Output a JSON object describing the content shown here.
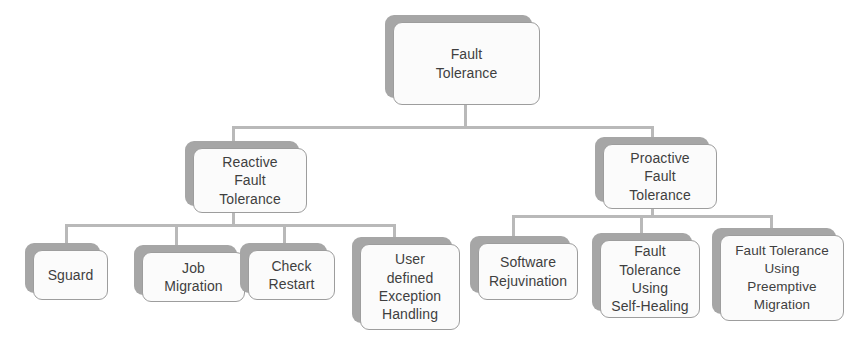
{
  "diagram": {
    "title": "Fault Tolerance",
    "type": "hierarchy-tree",
    "colors": {
      "background": "#ffffff",
      "box_fill": "#fbfbfb",
      "box_border": "#9d9d9d",
      "box_shadow_plate": "#a6a6a6",
      "connector": "#b9b9b9",
      "text": "#3f3f3f"
    },
    "root": {
      "label": "Fault\nTolerance"
    },
    "branches": [
      {
        "label": "Reactive\nFault\nTolerance",
        "children": [
          {
            "label": "Sguard"
          },
          {
            "label": "Job\nMigration"
          },
          {
            "label": "Check\nRestart"
          },
          {
            "label": "User\ndefined\nException\nHandling"
          }
        ]
      },
      {
        "label": "Proactive\nFault\nTolerance",
        "children": [
          {
            "label": "Software\nRejuvination"
          },
          {
            "label": "Fault\nTolerance\nUsing\nSelf-Healing"
          },
          {
            "label": "Fault Tolerance\nUsing\nPreemptive\nMigration"
          }
        ]
      }
    ]
  }
}
